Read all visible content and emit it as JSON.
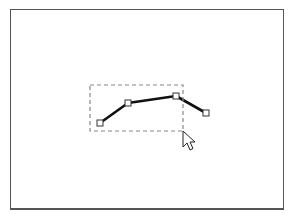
{
  "canvas": {
    "frame": {
      "x": 10,
      "y": 9,
      "width": 272,
      "height": 198,
      "border_color": "#555555"
    },
    "polyline": {
      "stroke": "#111111",
      "stroke_width": 2.6,
      "points": [
        {
          "x": 100,
          "y": 123
        },
        {
          "x": 128,
          "y": 103
        },
        {
          "x": 176,
          "y": 96
        },
        {
          "x": 206,
          "y": 113
        }
      ],
      "handle_size": 6,
      "handle_fill": "#ffffff",
      "handle_stroke": "#333333"
    },
    "selection_marquee": {
      "x": 90,
      "y": 85,
      "width": 93,
      "height": 46,
      "stroke": "#888888",
      "dash": "4,3"
    },
    "cursor": {
      "type": "arrow-pointer",
      "x": 183,
      "y": 131
    }
  }
}
